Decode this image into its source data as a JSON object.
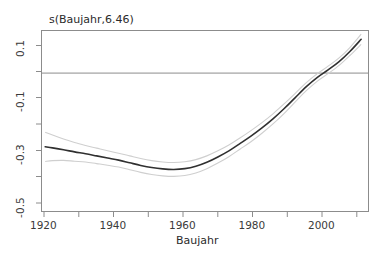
{
  "chart_data": {
    "type": "line",
    "title": "s(Baujahr,6.46)",
    "xlabel": "Baujahr",
    "ylabel": "s(Baujahr,6.46)",
    "xlim": [
      1918,
      2007
    ],
    "ylim": [
      -0.52,
      0.16
    ],
    "grid": false,
    "legend": "none",
    "xticks": [
      1920,
      1940,
      1960,
      1980,
      2000
    ],
    "xticklabels": [
      "1920",
      "1940",
      "1960",
      "1980",
      "2000"
    ],
    "yticks": [
      0.1,
      -0.1,
      -0.3,
      -0.5
    ],
    "yticklabels": [
      "0.1",
      "-0.1",
      "-0.3",
      "-0.5"
    ],
    "zero_reference_line": 0.0,
    "series": [
      {
        "name": "smooth-estimate",
        "role": "fit",
        "color": "#303030",
        "x": [
          1919,
          1921,
          1924,
          1927,
          1930,
          1933,
          1936,
          1939,
          1942,
          1945,
          1948,
          1951,
          1954,
          1957,
          1960,
          1963,
          1966,
          1969,
          1972,
          1975,
          1978,
          1981,
          1984,
          1987,
          1990,
          1993,
          1996,
          1999,
          2002,
          2005
        ],
        "values": [
          -0.277,
          -0.281,
          -0.288,
          -0.296,
          -0.303,
          -0.311,
          -0.319,
          -0.327,
          -0.337,
          -0.347,
          -0.355,
          -0.36,
          -0.362,
          -0.359,
          -0.35,
          -0.335,
          -0.315,
          -0.292,
          -0.265,
          -0.237,
          -0.206,
          -0.172,
          -0.134,
          -0.093,
          -0.052,
          -0.017,
          0.012,
          0.043,
          0.082,
          0.127
        ]
      },
      {
        "name": "upper-confidence-band",
        "role": "ci-upper",
        "color": "#cfcfcf",
        "x": [
          1919,
          1921,
          1924,
          1927,
          1930,
          1933,
          1936,
          1939,
          1942,
          1945,
          1948,
          1951,
          1954,
          1957,
          1960,
          1963,
          1966,
          1969,
          1972,
          1975,
          1978,
          1981,
          1984,
          1987,
          1990,
          1993,
          1996,
          1999,
          2002,
          2005
        ],
        "values": [
          -0.222,
          -0.233,
          -0.248,
          -0.261,
          -0.272,
          -0.282,
          -0.292,
          -0.301,
          -0.311,
          -0.321,
          -0.329,
          -0.334,
          -0.336,
          -0.333,
          -0.325,
          -0.311,
          -0.292,
          -0.27,
          -0.244,
          -0.216,
          -0.186,
          -0.153,
          -0.116,
          -0.077,
          -0.037,
          -0.003,
          0.026,
          0.057,
          0.097,
          0.146
        ]
      },
      {
        "name": "lower-confidence-band",
        "role": "ci-lower",
        "color": "#cfcfcf",
        "x": [
          1919,
          1921,
          1924,
          1927,
          1930,
          1933,
          1936,
          1939,
          1942,
          1945,
          1948,
          1951,
          1954,
          1957,
          1960,
          1963,
          1966,
          1969,
          1972,
          1975,
          1978,
          1981,
          1984,
          1987,
          1990,
          1993,
          1996,
          1999,
          2002,
          2005
        ],
        "values": [
          -0.332,
          -0.329,
          -0.328,
          -0.331,
          -0.334,
          -0.34,
          -0.346,
          -0.353,
          -0.363,
          -0.373,
          -0.381,
          -0.386,
          -0.388,
          -0.385,
          -0.375,
          -0.359,
          -0.338,
          -0.314,
          -0.286,
          -0.258,
          -0.226,
          -0.191,
          -0.152,
          -0.109,
          -0.067,
          -0.031,
          -0.002,
          0.029,
          0.067,
          0.108
        ]
      }
    ]
  },
  "axes": {
    "y_axis_label": "s(Baujahr,6.46)",
    "x_axis_label": "Baujahr",
    "y_tick_labels": [
      "0.1",
      "-0.1",
      "-0.3",
      "-0.5"
    ],
    "x_tick_labels": [
      "1920",
      "1940",
      "1960",
      "1980",
      "2000"
    ]
  }
}
